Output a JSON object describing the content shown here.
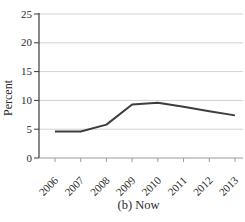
{
  "figure": {
    "caption": "(b) Now"
  },
  "chart_data": {
    "type": "line",
    "title": "",
    "xlabel": "",
    "ylabel": "Percent",
    "categories": [
      "2006",
      "2007",
      "2008",
      "2009",
      "2010",
      "2011",
      "2012",
      "2013"
    ],
    "values": [
      4.6,
      4.6,
      5.8,
      9.3,
      9.6,
      8.9,
      8.1,
      7.4
    ],
    "ylim": [
      0,
      25
    ],
    "yticks": [
      0,
      5,
      10,
      15,
      20,
      25
    ],
    "grid": "horizontal",
    "legend": "none",
    "colors": {
      "line": "#3d3d3d",
      "grid": "#d2d2d2",
      "y_axis": "#3a3a3a",
      "x_axis": "#9b9b9b",
      "text": "#2b2b2b"
    }
  }
}
